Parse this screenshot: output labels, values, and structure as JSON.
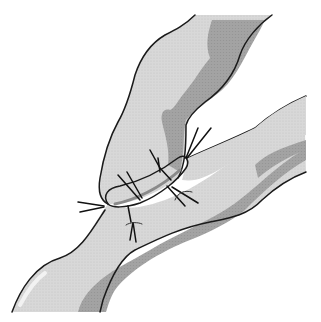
{
  "figure": {
    "elements": [
      "upper-vessel",
      "right-branch-vessel",
      "lower-vessel",
      "anastomosis-site",
      "sutures"
    ],
    "colors": {
      "vessel_light": "#d6d6d6",
      "vessel_dark": "#9e9e9e",
      "highlight": "#ececec",
      "outline": "#1a1a1a",
      "background": "#ffffff"
    }
  }
}
